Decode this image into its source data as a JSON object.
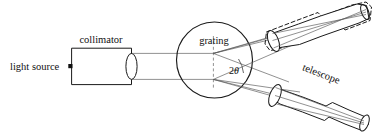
{
  "figure": {
    "name": "grating-spectrometer-diagram",
    "background_color": "#ffffff",
    "line_color": "#1a1a1a",
    "ray_color": "#555555",
    "width": 377,
    "height": 133
  },
  "labels": {
    "light_source": "light source",
    "collimator": "collimator",
    "grating": "grating",
    "telescope": "telescope",
    "angle": "2θ",
    "angle_number": "2",
    "angle_symbol": "θ"
  },
  "components": [
    {
      "id": "light-source",
      "label": "light source",
      "type": "point-source",
      "marker": "filled-square-dot"
    },
    {
      "id": "collimator",
      "label": "collimator",
      "type": "rectangular-tube-with-lens",
      "orientation": "horizontal"
    },
    {
      "id": "grating",
      "label": "grating",
      "type": "circle-with-dashed-axis"
    },
    {
      "id": "telescope-diffracted",
      "label": "telescope",
      "type": "tapered-tube-with-lens",
      "state": "solid",
      "position": "lower-right"
    },
    {
      "id": "telescope-direct",
      "label": "",
      "type": "tapered-tube-with-lens",
      "state": "dashed-ghost",
      "position": "upper-right"
    }
  ]
}
